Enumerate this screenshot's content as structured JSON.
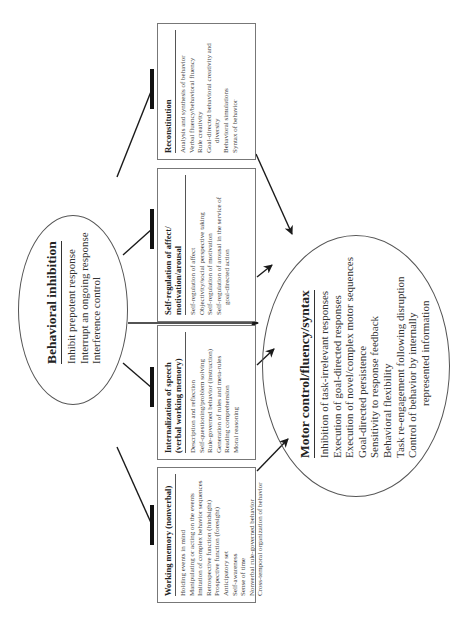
{
  "diagram": {
    "orientation": "rotated-90-ccw",
    "behavioral_inhibition": {
      "title": "Behavioral inhibition",
      "items": [
        "Inhibit prepotent response",
        "Interrupt an ongoing response",
        "Interference control"
      ]
    },
    "boxes": [
      {
        "id": "working-memory",
        "title": "Working memory (nonverbal)",
        "items": [
          "Holding events in mind",
          "Manipulating or acting on the events",
          "Imitation of complex behavior sequences",
          "Retrospective function (hindsight)",
          "Prospective function (foresight)",
          "Anticipatory set",
          "Self-awareness",
          "Sense of time",
          "Nonverbal rule-governed behavior",
          "Cross-temporal organization of behavior"
        ]
      },
      {
        "id": "internalization-of-speech",
        "title_line1": "Internalization of speech",
        "title_line2": "(verbal working memory)",
        "items": [
          "Description and reflection",
          "Self-questioning/problem solving",
          "Rule-governed behavior (instruction)",
          "Generation of rules and meta-rules",
          "Reading comprehension",
          "Moral reasoning"
        ]
      },
      {
        "id": "self-regulation",
        "title_line1": "Self-regulation of affect/",
        "title_line2": "motivation/arousal",
        "items": [
          "Self-regulation of affect",
          "Objectivity/social perspective taking",
          "Self-regulation of motivation",
          "Self-regulation of arousal in the service of",
          "goal-directed action"
        ]
      },
      {
        "id": "reconstitution",
        "title": "Reconstitution",
        "items": [
          "Analysis and synthesis of behavior",
          "Verbal fluency/behavioral fluency",
          "Rule creativity",
          "Goal-directed behavioral creativity and",
          "diversity",
          "Behavioral simulations",
          "Syntax of behavior"
        ]
      }
    ],
    "motor_control": {
      "title": "Motor control/fluency/syntax",
      "items": [
        "Inhibition of task-irrelevant responses",
        "Execution of goal-directed responses",
        "Execution of novel/complex motor sequences",
        "Goal-directed persistence",
        "Sensitivity to response feedback",
        "Behavioral flexibility",
        "Task re-engagement following disruption",
        "Control of behavior by internally",
        "represented information"
      ]
    },
    "colors": {
      "line": "#1a1a1a",
      "box_border": "#777777",
      "text": "#2a2a2a"
    }
  }
}
